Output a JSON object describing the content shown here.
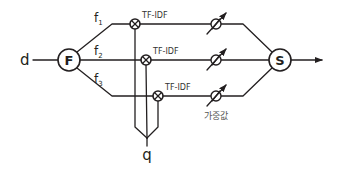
{
  "diagram": {
    "input_label": "d",
    "query_label": "q",
    "feature_node": {
      "label": "F"
    },
    "sum_node": {
      "label": "S"
    },
    "branches": [
      {
        "feature": "f",
        "subscript": "1",
        "op_label": "TF-IDF"
      },
      {
        "feature": "f",
        "subscript": "2",
        "op_label": "TF-IDF"
      },
      {
        "feature": "f",
        "subscript": "3",
        "op_label": "TF-IDF"
      }
    ],
    "weight_label": "가중값",
    "colors": {
      "stroke": "#231f20",
      "background": "#ffffff",
      "weight_label": "#555555"
    }
  }
}
